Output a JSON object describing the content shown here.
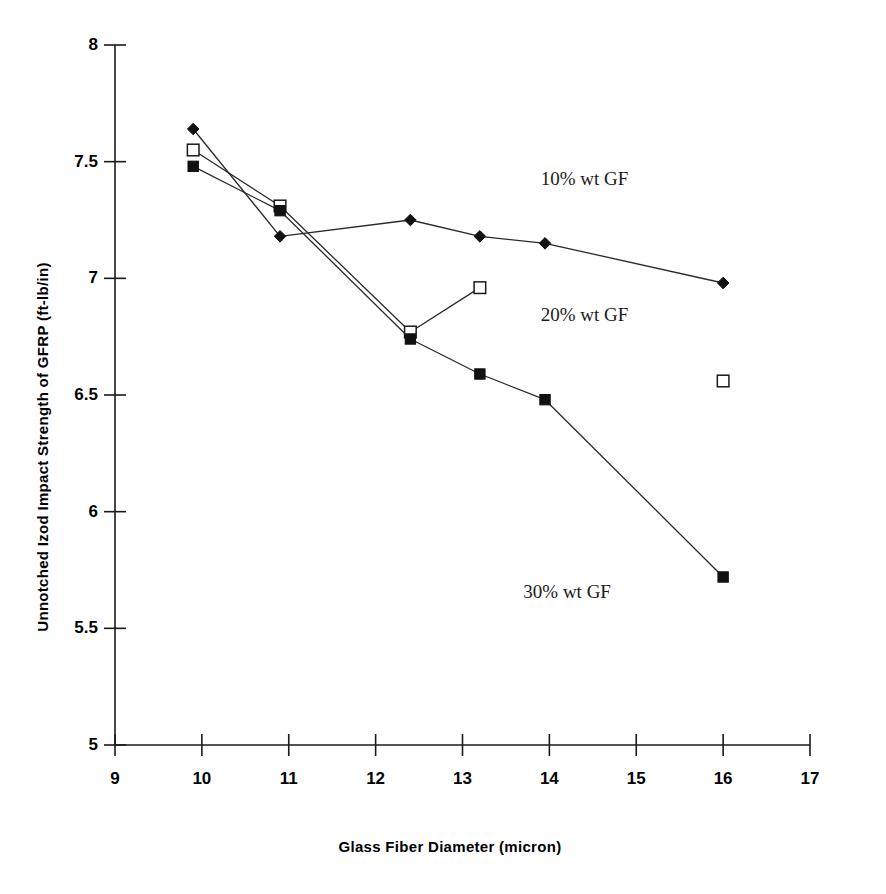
{
  "chart_data": {
    "type": "line",
    "title": "",
    "xlabel": "Glass Fiber Diameter (micron)",
    "ylabel": "Unnotched Izod Impact Strength of GFRP (ft-lb/in)",
    "xlim": [
      9,
      17
    ],
    "ylim": [
      5,
      8
    ],
    "xticks": [
      "9",
      "10",
      "11",
      "12",
      "13",
      "14",
      "15",
      "16",
      "17"
    ],
    "yticks": [
      "5",
      "5.5",
      "6",
      "6.5",
      "7",
      "7.5",
      "8"
    ],
    "grid": false,
    "legend_position": "inline-annotation",
    "series": [
      {
        "name": "10% wt GF",
        "marker": "filled-diamond",
        "color": "#000000",
        "x": [
          9.9,
          10.9,
          12.4,
          13.2,
          13.95,
          16.0
        ],
        "y": [
          7.64,
          7.18,
          7.25,
          7.18,
          7.15,
          6.98
        ]
      },
      {
        "name": "20% wt GF",
        "marker": "open-square",
        "color": "#000000",
        "x": [
          9.9,
          10.9,
          12.4,
          13.2
        ],
        "y": [
          7.55,
          7.31,
          6.77,
          6.96
        ]
      },
      {
        "name": "20% wt GF (isolated point)",
        "marker": "open-square",
        "color": "#000000",
        "connected": false,
        "x": [
          16.0
        ],
        "y": [
          6.56
        ]
      },
      {
        "name": "30% wt GF",
        "marker": "filled-square",
        "color": "#000000",
        "x": [
          9.9,
          10.9,
          12.4,
          13.2,
          13.95,
          16.0
        ],
        "y": [
          7.48,
          7.29,
          6.74,
          6.59,
          6.48,
          5.72
        ]
      }
    ],
    "annotations": [
      {
        "text": "10% wt GF",
        "x": 13.9,
        "y": 7.42
      },
      {
        "text": "20% wt GF",
        "x": 13.9,
        "y": 6.84
      },
      {
        "text": "30% wt GF",
        "x": 13.7,
        "y": 5.65
      }
    ]
  },
  "axis": {
    "y_title": "Unnotched Izod Impact Strength of GFRP (ft-lb/in)",
    "x_title": "Glass Fiber Diameter (micron)",
    "y_tick_labels": [
      "8",
      "7.5",
      "7",
      "6.5",
      "6",
      "5.5",
      "5"
    ],
    "x_tick_labels": [
      "9",
      "10",
      "11",
      "12",
      "13",
      "14",
      "15",
      "16",
      "17"
    ]
  },
  "annotations": {
    "series_10": "10% wt GF",
    "series_20": "20% wt GF",
    "series_30": "30% wt GF"
  },
  "colors": {
    "axis": "#1a1a1a",
    "line": "#2a2a2a",
    "marker_fill": "#111111",
    "marker_open_fill": "#ffffff",
    "text": "#000000"
  }
}
